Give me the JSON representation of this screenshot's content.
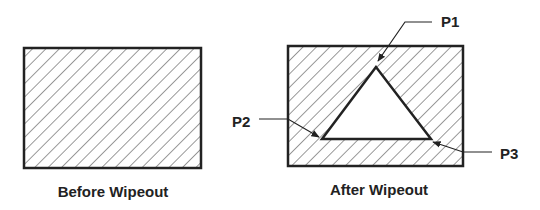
{
  "diagram": {
    "type": "before-after illustration",
    "colors": {
      "stroke": "#222222",
      "hatch": "#333333",
      "background": "#ffffff",
      "text": "#222222"
    },
    "panels": [
      {
        "id": "before",
        "caption": "Before Wipeout",
        "shape": "hatched-rectangle"
      },
      {
        "id": "after",
        "caption": "After Wipeout",
        "shape": "hatched-rectangle-with-triangular-wipeout",
        "points": [
          {
            "label": "P1",
            "position": "apex"
          },
          {
            "label": "P2",
            "position": "bottom-left"
          },
          {
            "label": "P3",
            "position": "bottom-right"
          }
        ]
      }
    ]
  }
}
